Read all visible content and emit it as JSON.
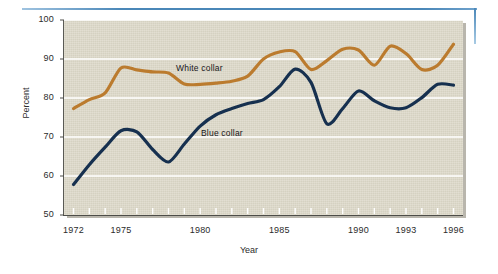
{
  "figure": {
    "background_color": "#ffffff",
    "plot_background_color": "#ddd9c9",
    "gridline_color": "#ffffff",
    "decoration": {
      "top_rule_color": "#4a87b8",
      "right_rule_color": "#4a87b8"
    }
  },
  "axes": {
    "y_title": "Percent",
    "x_title": "Year",
    "y_ticks": [
      "50",
      "60",
      "70",
      "80",
      "90",
      "100"
    ],
    "x_ticks": [
      "1972",
      "1975",
      "1980",
      "1985",
      "1990",
      "1993",
      "1996"
    ]
  },
  "series_labels": {
    "white_collar": "White collar",
    "blue_collar": "Blue collar"
  },
  "chart_data": {
    "type": "line",
    "title": "",
    "xlabel": "Year",
    "ylabel": "Percent",
    "xlim": [
      1971.4,
      1996.6
    ],
    "ylim": [
      50,
      100
    ],
    "grid": true,
    "grid_axis": "y",
    "legend": "inline-labels",
    "x": [
      1972,
      1973,
      1974,
      1975,
      1976,
      1977,
      1978,
      1979,
      1980,
      1981,
      1982,
      1983,
      1984,
      1985,
      1986,
      1987,
      1988,
      1989,
      1990,
      1991,
      1992,
      1993,
      1994,
      1995,
      1996
    ],
    "series": [
      {
        "name": "White collar",
        "color": "#bb7b2e",
        "values": [
          77.3,
          79.6,
          81.3,
          87.7,
          87.2,
          86.7,
          86.4,
          83.6,
          83.5,
          83.8,
          84.3,
          85.6,
          90.0,
          91.8,
          91.9,
          87.3,
          89.6,
          92.5,
          92.3,
          88.4,
          93.3,
          91.4,
          87.3,
          88.4,
          93.8
        ]
      },
      {
        "name": "Blue collar",
        "color": "#16304f",
        "values": [
          57.8,
          62.9,
          67.4,
          71.6,
          71.3,
          66.8,
          63.6,
          68.2,
          72.8,
          75.7,
          77.3,
          78.6,
          79.6,
          82.9,
          87.4,
          84.0,
          73.4,
          77.3,
          81.8,
          79.3,
          77.5,
          77.5,
          80.1,
          83.5,
          83.3
        ]
      }
    ],
    "annotations": [
      {
        "text": "White collar",
        "x": 1979.3,
        "y": 88.5
      },
      {
        "text": "Blue collar",
        "x": 1981.1,
        "y": 72.5
      }
    ]
  }
}
